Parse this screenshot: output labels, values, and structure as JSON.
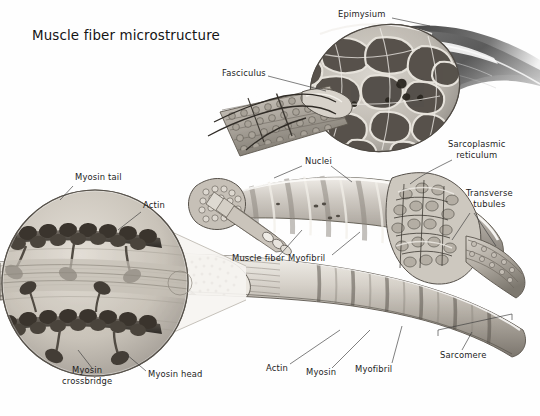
{
  "figure": {
    "title": "Muscle fiber microstructure",
    "style": "grayscale anatomical illustration",
    "background_color": "#fefefe",
    "text_color": "#1c1c1c",
    "leader_line_color": "#3a3a3a"
  },
  "labels": [
    {
      "id": "epimysium",
      "text": "Epimysium",
      "x": 338,
      "y": 14,
      "align": "left",
      "leader": [
        [
          395,
          19
        ],
        [
          425,
          26
        ]
      ]
    },
    {
      "id": "fasciculus",
      "text": "Fasciculus",
      "x": 222,
      "y": 73,
      "align": "left",
      "leader": [
        [
          270,
          77
        ],
        [
          322,
          89
        ]
      ]
    },
    {
      "id": "nuclei",
      "text": "Nuclei",
      "x": 305,
      "y": 161,
      "align": "left",
      "leader": [
        [
          303,
          166
        ],
        [
          272,
          175
        ]
      ]
    },
    {
      "id": "nuclei-2",
      "text": "",
      "x": 0,
      "y": 0,
      "align": "left",
      "leader": [
        [
          333,
          166
        ],
        [
          352,
          180
        ]
      ]
    },
    {
      "id": "sarcoplasmic-reticulum",
      "text": "Sarcoplasmic\nreticulum",
      "x": 450,
      "y": 144,
      "align": "left",
      "leader": [
        [
          452,
          160
        ],
        [
          412,
          182
        ]
      ]
    },
    {
      "id": "transverse-tubules",
      "text": "Transverse\ntubules",
      "x": 468,
      "y": 193,
      "align": "left",
      "leader": [
        [
          470,
          215
        ],
        [
          452,
          240
        ]
      ]
    },
    {
      "id": "myosin-tail",
      "text": "Myosin tail",
      "x": 75,
      "y": 177,
      "align": "left",
      "leader": [
        [
          73,
          186
        ],
        [
          62,
          200
        ]
      ]
    },
    {
      "id": "actin-inset",
      "text": "Actin",
      "x": 143,
      "y": 205,
      "align": "left",
      "leader": [
        [
          141,
          212
        ],
        [
          120,
          228
        ]
      ]
    },
    {
      "id": "muscle-fiber",
      "text": "Muscle fiber",
      "x": 232,
      "y": 258,
      "align": "left",
      "leader": [
        [
          278,
          258
        ],
        [
          300,
          232
        ]
      ]
    },
    {
      "id": "myofibril-mid",
      "text": "Myofibril",
      "x": 288,
      "y": 258,
      "align": "left",
      "leader": [
        [
          330,
          256
        ],
        [
          358,
          232
        ]
      ]
    },
    {
      "id": "myosin-crossbridge",
      "text": "Myosin\ncrossbridge",
      "x": 88,
      "y": 370,
      "align": "left",
      "leader": [
        [
          92,
          370
        ],
        [
          78,
          352
        ]
      ]
    },
    {
      "id": "myosin-head",
      "text": "Myosin head",
      "x": 148,
      "y": 374,
      "align": "left",
      "leader": [
        [
          146,
          373
        ],
        [
          128,
          356
        ]
      ]
    },
    {
      "id": "actin-bottom",
      "text": "Actin",
      "x": 266,
      "y": 368,
      "align": "left",
      "leader": [
        [
          290,
          366
        ],
        [
          338,
          333
        ]
      ]
    },
    {
      "id": "myosin-bottom",
      "text": "Myosin",
      "x": 306,
      "y": 372,
      "align": "left",
      "leader": [
        [
          330,
          370
        ],
        [
          368,
          333
        ]
      ]
    },
    {
      "id": "myofibril-bottom",
      "text": "Myofibril",
      "x": 355,
      "y": 369,
      "align": "left",
      "leader": [
        [
          390,
          366
        ],
        [
          400,
          327
        ]
      ]
    },
    {
      "id": "sarcomere",
      "text": "Sarcomere",
      "x": 440,
      "y": 355,
      "align": "left",
      "leader": [
        [
          462,
          352
        ],
        [
          472,
          335
        ]
      ]
    }
  ],
  "structures": {
    "whole_muscle": "tapering muscle belly with epimysium sheath, cut cross-section revealing fascicles",
    "fascicle_bundle": "cylindrical bundle of muscle fibers extending toward lower left",
    "muscle_fiber": "large banded cylinder showing nuclei and internal myofibrils",
    "myofibril_strip": "long striated ribbon showing sarcomere banding at bottom",
    "magnified_inset": "circular magnification of myosin filament with heads, crossbridges, and actin"
  }
}
